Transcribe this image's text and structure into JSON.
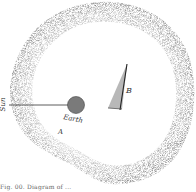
{
  "figure": {
    "labels": {
      "sun": "Sun",
      "earth": "Earth",
      "a": "A",
      "b": "B"
    },
    "caption": "Fig. 00. Diagram of ...",
    "colors": {
      "ring_dark": "#5a5a5a",
      "ring_light": "#bdbdbd",
      "earth_fill": "#7a7a7a",
      "line": "#333333",
      "background": "#ffffff"
    }
  }
}
